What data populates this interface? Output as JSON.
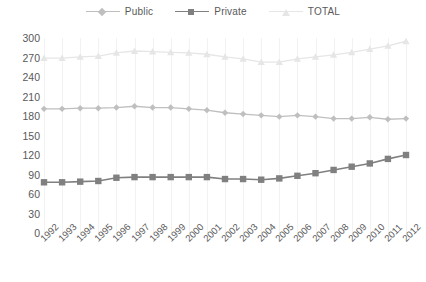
{
  "chart_data": {
    "type": "line",
    "title": "",
    "subtitle": "",
    "xlabel": "",
    "ylabel": "",
    "grid": "vertical",
    "legend_position": "top-center",
    "ylim": [
      0,
      300
    ],
    "yticks": [
      0,
      30,
      60,
      90,
      120,
      150,
      180,
      210,
      240,
      270,
      300
    ],
    "categories": [
      "1992",
      "1993",
      "1994",
      "1995",
      "1996",
      "1997",
      "1998",
      "1999",
      "2000",
      "2001",
      "2002",
      "2003",
      "2004",
      "2005",
      "2006",
      "2007",
      "2008",
      "2009",
      "2010",
      "2011",
      "2012"
    ],
    "series": [
      {
        "name": "Public",
        "color": "#bfbfbf",
        "marker": "diamond",
        "values": [
          191,
          191,
          192,
          192,
          193,
          195,
          193,
          193,
          191,
          189,
          185,
          183,
          181,
          179,
          181,
          179,
          176,
          176,
          178,
          175,
          176
        ]
      },
      {
        "name": "Private",
        "color": "#808080",
        "marker": "square",
        "values": [
          78,
          78,
          79,
          80,
          85,
          86,
          86,
          86,
          86,
          86,
          83,
          83,
          82,
          84,
          88,
          92,
          97,
          102,
          107,
          114,
          120
        ]
      },
      {
        "name": "TOTAL",
        "color": "#e6e6e6",
        "marker": "triangle",
        "values": [
          269,
          269,
          271,
          272,
          277,
          280,
          279,
          278,
          277,
          275,
          271,
          268,
          263,
          263,
          268,
          271,
          274,
          278,
          283,
          288,
          295
        ]
      }
    ]
  },
  "legend": {
    "items": [
      {
        "label": "Public",
        "color": "#bfbfbf",
        "marker": "diamond"
      },
      {
        "label": "Private",
        "color": "#808080",
        "marker": "square"
      },
      {
        "label": "TOTAL",
        "color": "#e6e6e6",
        "marker": "triangle"
      }
    ]
  },
  "axes": {
    "y_ticks": [
      "300",
      "270",
      "240",
      "210",
      "180",
      "150",
      "120",
      "90",
      "60",
      "30",
      "0"
    ],
    "x_ticks": [
      "1992",
      "1993",
      "1994",
      "1995",
      "1996",
      "1997",
      "1998",
      "1999",
      "2000",
      "2001",
      "2002",
      "2003",
      "2004",
      "2005",
      "2006",
      "2007",
      "2008",
      "2009",
      "2010",
      "2011",
      "2012"
    ]
  }
}
